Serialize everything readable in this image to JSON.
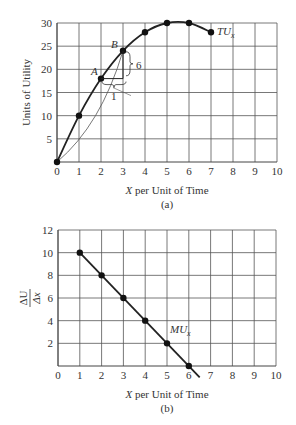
{
  "chart_data": [
    {
      "type": "line",
      "panel_label": "(a)",
      "title": "",
      "xlabel": "X per Unit of Time",
      "ylabel": "Units of Utility",
      "xlim": [
        0,
        10
      ],
      "ylim": [
        0,
        30
      ],
      "x_ticks": [
        "0",
        "1",
        "2",
        "3",
        "4",
        "5",
        "6",
        "7",
        "8",
        "9",
        "10"
      ],
      "y_ticks": [
        "5",
        "10",
        "15",
        "20",
        "25",
        "30"
      ],
      "grid": true,
      "series": [
        {
          "name": "TUx",
          "x": [
            0,
            1,
            2,
            3,
            4,
            5,
            6,
            7
          ],
          "values": [
            0,
            10,
            18,
            24,
            28,
            30,
            30,
            28
          ]
        }
      ],
      "annotations": [
        {
          "text": "A",
          "x": 2,
          "y": 18
        },
        {
          "text": "B",
          "x": 3,
          "y": 24
        },
        {
          "text": "6",
          "note": "rise between A and B"
        },
        {
          "text": "1",
          "note": "run between A and B"
        }
      ],
      "curve_label": "TU",
      "curve_label_sub": "x"
    },
    {
      "type": "line",
      "panel_label": "(b)",
      "title": "",
      "xlabel": "X per Unit of Time",
      "ylabel": "ΔU/Δx",
      "ylabel_num": "ΔU",
      "ylabel_den": "Δx",
      "xlim": [
        0,
        10
      ],
      "ylim": [
        0,
        12
      ],
      "x_ticks": [
        "0",
        "1",
        "2",
        "3",
        "4",
        "5",
        "6",
        "7",
        "8",
        "9",
        "10"
      ],
      "y_ticks": [
        "2",
        "4",
        "6",
        "8",
        "10",
        "12"
      ],
      "grid": true,
      "series": [
        {
          "name": "MUx",
          "x": [
            1,
            2,
            3,
            4,
            5,
            6
          ],
          "values": [
            10,
            8,
            6,
            4,
            2,
            0
          ]
        }
      ],
      "curve_label": "MU",
      "curve_label_sub": "x"
    }
  ]
}
